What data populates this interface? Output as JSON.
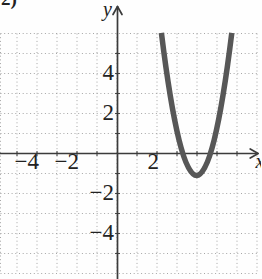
{
  "page": {
    "partial_exercise_label": "2)"
  },
  "colors": {
    "background": "#fefefe",
    "grid_dots": "#a6a6a6",
    "axis": "#3b3b3b",
    "tick": "#4a4a4a",
    "label_text": "#222222",
    "curve": "#575757"
  },
  "chart_data": {
    "type": "line",
    "title": "",
    "function_fit": "y ≈ 2.3(x − 4)² − 1.1",
    "xlabel": "x",
    "ylabel": "y",
    "xlim": [
      -5.85,
      7.2
    ],
    "ylim": [
      -6.3,
      7.7
    ],
    "grid": true,
    "grid_step": 1,
    "grid_x_range": [
      -6,
      7
    ],
    "grid_y_range": [
      -6,
      6
    ],
    "x_tick_range": [
      -5,
      6
    ],
    "y_tick_range": [
      -5,
      5
    ],
    "x_tick_labels": [
      {
        "value": -4,
        "text": "−4"
      },
      {
        "value": -2,
        "text": "−2"
      },
      {
        "value": 2,
        "text": "2"
      }
    ],
    "y_tick_labels": [
      {
        "value": 4,
        "text": "4"
      },
      {
        "value": 2,
        "text": "2"
      },
      {
        "value": -2,
        "text": "−2"
      },
      {
        "value": -4,
        "text": "−4"
      }
    ],
    "series": [
      {
        "name": "parabola",
        "vertex": [
          3.98,
          -1.1
        ],
        "a": 2.3,
        "y_top": 6.03,
        "x_intercepts": [
          3.3,
          4.67
        ],
        "sample_points": [
          [
            2.2,
            6.0
          ],
          [
            3.3,
            0.0
          ],
          [
            3.98,
            -1.1
          ],
          [
            4.67,
            0.0
          ],
          [
            5.75,
            6.0
          ]
        ]
      }
    ],
    "layout_px": {
      "origin": [
        117,
        153.5
      ],
      "unit": 20,
      "x_axis_end": 256,
      "x_arrow_tip": 258.2,
      "y_axis_top": 6.5,
      "y_axis_bottom": 279
    }
  }
}
